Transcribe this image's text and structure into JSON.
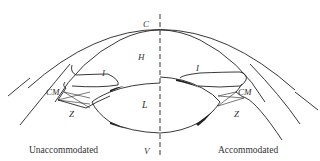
{
  "figure": {
    "labels": {
      "cornea": "C",
      "aqueous_humor": "H",
      "iris_left": "I",
      "iris_right": "I",
      "ciliary_muscle_left": "CM",
      "ciliary_muscle_right": "CM",
      "zonule_left": "Z",
      "zonule_right": "Z",
      "lens": "L",
      "vitreous": "V"
    },
    "captions": {
      "left": "Unaccommodated",
      "right": "Accommodated"
    },
    "colors": {
      "line": "#222222",
      "background": "#ffffff"
    }
  }
}
